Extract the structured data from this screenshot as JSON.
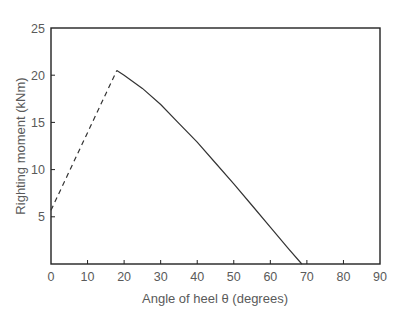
{
  "chart_data": {
    "type": "line",
    "title": "",
    "xlabel": "Angle of heel θ (degrees)",
    "ylabel": "Righting moment (kNm)",
    "xlim": [
      0,
      90
    ],
    "ylim": [
      0,
      25
    ],
    "x_ticks": [
      0,
      10,
      20,
      30,
      40,
      50,
      60,
      70,
      80,
      90
    ],
    "y_ticks": [
      5,
      10,
      15,
      20,
      25
    ],
    "grid": false,
    "legend": null,
    "series": [
      {
        "name": "righting moment (extrapolated)",
        "style": "dashed",
        "x": [
          0,
          18
        ],
        "y": [
          5.7,
          20.5
        ]
      },
      {
        "name": "righting moment",
        "style": "solid",
        "x": [
          18,
          20,
          25,
          30,
          35,
          40,
          45,
          50,
          55,
          60,
          65,
          68.6
        ],
        "y": [
          20.5,
          20.0,
          18.6,
          16.9,
          14.9,
          12.9,
          10.7,
          8.5,
          6.2,
          3.9,
          1.6,
          0
        ]
      }
    ]
  },
  "colors": {
    "axis": "#222222",
    "line": "#333333",
    "text": "#5a5a5a"
  }
}
